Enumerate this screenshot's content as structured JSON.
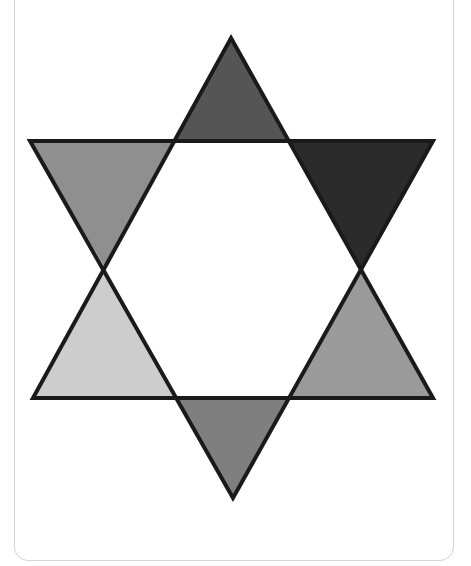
{
  "figure": {
    "type": "hexagram",
    "stroke_color": "#1a1a1a",
    "center_fill": "#ffffff",
    "triangles": [
      {
        "name": "top",
        "fill": "#555555",
        "points": "231,38 288,141 175,141"
      },
      {
        "name": "upper-right",
        "fill": "#2b2b2b",
        "points": "288,141 433,141 360,268"
      },
      {
        "name": "lower-right",
        "fill": "#9a9a9a",
        "points": "360,268 433,398 289,398"
      },
      {
        "name": "bottom",
        "fill": "#7f7f7f",
        "points": "289,398 233,498 176,398"
      },
      {
        "name": "lower-left",
        "fill": "#cdcdcd",
        "points": "176,398 33,398 105,268"
      },
      {
        "name": "upper-left",
        "fill": "#8f8f8f",
        "points": "105,268 30,141 175,141"
      }
    ],
    "hexagon": "175,141 288,141 360,268 289,398 176,398 105,268"
  }
}
